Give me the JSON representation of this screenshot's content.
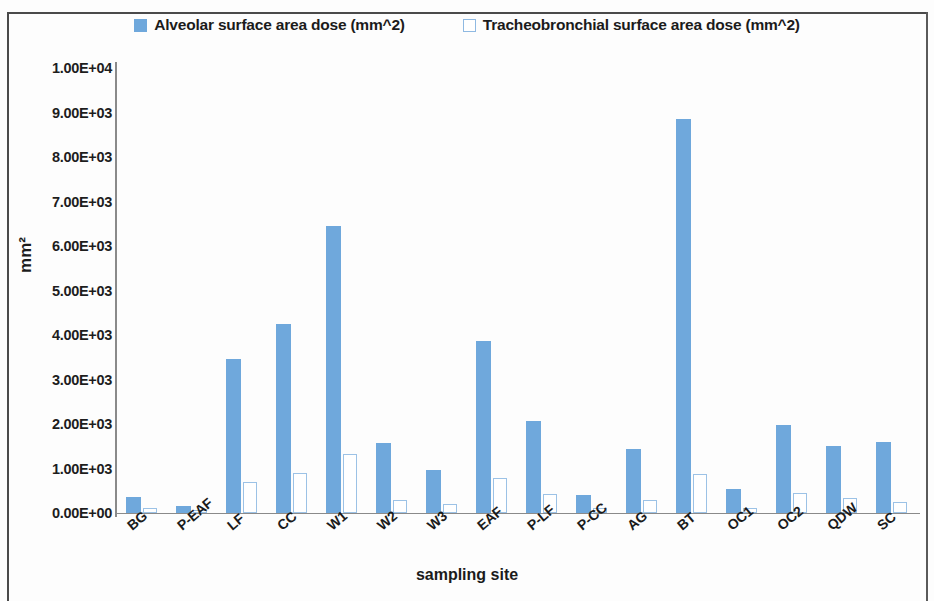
{
  "legend": {
    "items": [
      {
        "label": "Alveolar surface area dose (mm^2)",
        "swatch": "filled-square-icon",
        "color": "#6fa8dc"
      },
      {
        "label": "Tracheobronchial surface area dose (mm^2)",
        "swatch": "hollow-square-icon",
        "color": "#ffffff"
      }
    ]
  },
  "axes": {
    "ylabel": "mm²",
    "xlabel": "sampling  site",
    "yticks": [
      "0.00E+00",
      "1.00E+03",
      "2.00E+03",
      "3.00E+03",
      "4.00E+03",
      "5.00E+03",
      "6.00E+03",
      "7.00E+03",
      "8.00E+03",
      "9.00E+03",
      "1.00E+04"
    ]
  },
  "chart_data": {
    "type": "bar",
    "title": "",
    "xlabel": "sampling  site",
    "ylabel": "mm²",
    "ylim": [
      0,
      10000
    ],
    "ytick_values": [
      0,
      1000,
      2000,
      3000,
      4000,
      5000,
      6000,
      7000,
      8000,
      9000,
      10000
    ],
    "ytick_labels": [
      "0.00E+00",
      "1.00E+03",
      "2.00E+03",
      "3.00E+03",
      "4.00E+03",
      "5.00E+03",
      "6.00E+03",
      "7.00E+03",
      "8.00E+03",
      "9.00E+03",
      "1.00E+04"
    ],
    "grid": false,
    "legend_position": "top-center",
    "categories": [
      "BG",
      "P-EAF",
      "LF",
      "CC",
      "W1",
      "W2",
      "W3",
      "EAF",
      "P-LF",
      "P-CC",
      "AG",
      "BT",
      "OC1",
      "OC2",
      "QDW",
      "SC"
    ],
    "series": [
      {
        "name": "Alveolar surface area dose (mm^2)",
        "color": "#6fa8dc",
        "values": [
          360,
          160,
          3450,
          4250,
          6450,
          1570,
          970,
          3860,
          2060,
          400,
          1430,
          8850,
          540,
          1980,
          1510,
          1600
        ]
      },
      {
        "name": "Tracheobronchial surface area dose (mm^2)",
        "color": "#ffffff",
        "border_color": "#9cc2e6",
        "values": [
          110,
          50,
          690,
          900,
          1330,
          300,
          210,
          790,
          430,
          120,
          300,
          880,
          120,
          440,
          330,
          240
        ]
      }
    ]
  }
}
